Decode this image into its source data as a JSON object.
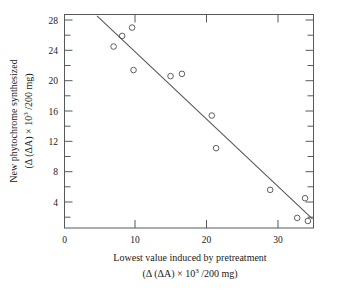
{
  "chart_data": {
    "type": "scatter",
    "title": "",
    "xlabel": "Lowest value induced by pretreatment",
    "xlabel_line2": "(Δ (ΔA) × 10³ /200 mg)",
    "ylabel": "New phytochrome synthesized",
    "ylabel_line2": "(Δ (ΔA) × 10³ /200 mg)",
    "xlim": [
      0,
      35
    ],
    "ylim": [
      0,
      29.5
    ],
    "xticks": [
      0,
      10,
      20,
      30
    ],
    "xtick_labels": [
      "0",
      "10",
      "20",
      "30"
    ],
    "yticks": [
      4,
      8,
      12,
      16,
      20,
      24,
      28
    ],
    "ytick_labels": [
      "4",
      "8",
      "12",
      "16",
      "20",
      "24",
      "28"
    ],
    "y_minor_ticks": [
      2,
      6,
      10,
      14,
      18,
      22,
      26
    ],
    "x_minor_ticks": [],
    "grid": false,
    "legend": null,
    "frame": "box",
    "marker": "open-circle",
    "marker_color": "#4a4f55",
    "line_color": "#55595e",
    "x": [
      6.9,
      8.1,
      9.5,
      9.7,
      14.9,
      16.5,
      20.7,
      21.3,
      28.9,
      32.7,
      33.8,
      34.2
    ],
    "y": [
      24.5,
      25.9,
      27.0,
      21.4,
      20.6,
      20.9,
      15.4,
      11.1,
      5.6,
      1.9,
      4.5,
      1.5
    ],
    "points": [
      {
        "x": 6.9,
        "y": 24.5
      },
      {
        "x": 8.1,
        "y": 25.9
      },
      {
        "x": 9.5,
        "y": 27.0
      },
      {
        "x": 9.7,
        "y": 21.4
      },
      {
        "x": 14.9,
        "y": 20.6
      },
      {
        "x": 16.5,
        "y": 20.9
      },
      {
        "x": 20.7,
        "y": 15.4
      },
      {
        "x": 21.3,
        "y": 11.1
      },
      {
        "x": 28.9,
        "y": 5.6
      },
      {
        "x": 32.7,
        "y": 1.9
      },
      {
        "x": 33.8,
        "y": 4.5
      },
      {
        "x": 34.2,
        "y": 1.5
      }
    ],
    "fit_line": {
      "type": "linear",
      "x_start": 4.6,
      "y_start": 28.5,
      "x_end": 34.8,
      "y_end": 1.8
    }
  },
  "axis": {
    "x_title_line1": "Lowest value induced by pretreatment",
    "x_title_prefix": "(Δ (ΔA) × 10",
    "x_title_sup": "3",
    "x_title_suffix": " /200 mg)",
    "y_title_line1": "New phytochrome synthesized",
    "y_title_prefix": "(Δ (ΔA) × 10",
    "y_title_sup": "3",
    "y_title_suffix": " /200 mg)"
  },
  "ticklabels": {
    "x": [
      "0",
      "10",
      "20",
      "30"
    ],
    "y": [
      "4",
      "8",
      "12",
      "16",
      "20",
      "24",
      "28"
    ]
  }
}
